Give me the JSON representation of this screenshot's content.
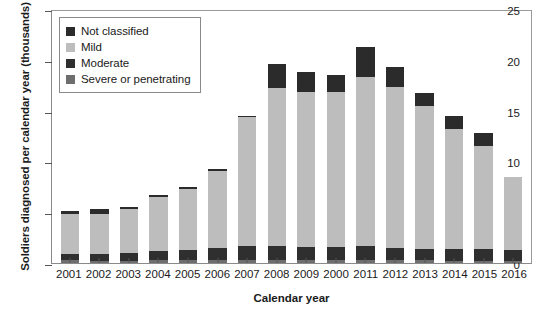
{
  "chart_data": {
    "type": "bar",
    "subtype": "stacked",
    "title": "",
    "xlabel": "Calendar year",
    "ylabel": "Soldiers diagnosed per calendar year (thousands)",
    "ylim": [
      0,
      25
    ],
    "yticks": [
      0,
      5,
      10,
      15,
      20,
      25
    ],
    "ytick_labels": [
      "0",
      "5",
      "10",
      "15",
      "20",
      "25"
    ],
    "grid": false,
    "legend_position": "upper left",
    "legend_order": [
      "Not classified",
      "Mild",
      "Moderate",
      "Severe or penetrating"
    ],
    "stack_order_bottom_to_top": [
      "Severe or penetrating",
      "Moderate",
      "Mild",
      "Not classified"
    ],
    "categories": [
      "2001",
      "2002",
      "2003",
      "2004",
      "2005",
      "2006",
      "2007",
      "2008",
      "2009",
      "2000",
      "2011",
      "2012",
      "2013",
      "2014",
      "2015",
      "2016"
    ],
    "series": [
      {
        "name": "Severe or penetrating",
        "color": "#6e6e6e",
        "values": [
          0.25,
          0.2,
          0.2,
          0.25,
          0.25,
          0.3,
          0.3,
          0.3,
          0.3,
          0.3,
          0.3,
          0.25,
          0.25,
          0.2,
          0.2,
          0.2
        ]
      },
      {
        "name": "Moderate",
        "color": "#2f2f2f",
        "values": [
          0.65,
          0.7,
          0.75,
          0.95,
          1.0,
          1.2,
          1.4,
          1.4,
          1.3,
          1.3,
          1.4,
          1.2,
          1.1,
          1.2,
          1.2,
          1.1
        ]
      },
      {
        "name": "Mild",
        "color": "#bdbdbd",
        "values": [
          3.95,
          3.95,
          4.35,
          5.3,
          6.05,
          7.55,
          12.7,
          15.5,
          15.2,
          15.2,
          16.6,
          15.9,
          14.1,
          11.8,
          10.1,
          7.2
        ]
      },
      {
        "name": "Not classified",
        "color": "#2b2b2b",
        "values": [
          0.25,
          0.45,
          0.2,
          0.2,
          0.2,
          0.2,
          0.1,
          2.4,
          2.0,
          1.7,
          3.0,
          1.9,
          1.3,
          1.3,
          1.3,
          0.0
        ]
      }
    ],
    "totals": [
      5.1,
      5.3,
      5.5,
      6.7,
      7.5,
      9.25,
      14.5,
      19.6,
      18.8,
      18.5,
      21.3,
      19.25,
      16.75,
      14.5,
      12.8,
      8.5
    ],
    "colors": {
      "not_classified": "#2b2b2b",
      "mild": "#bdbdbd",
      "moderate": "#2f2f2f",
      "severe": "#6e6e6e",
      "axis": "#555555",
      "frame": "#8a8a8a",
      "text": "#1a1a1a",
      "background": "#ffffff"
    }
  }
}
